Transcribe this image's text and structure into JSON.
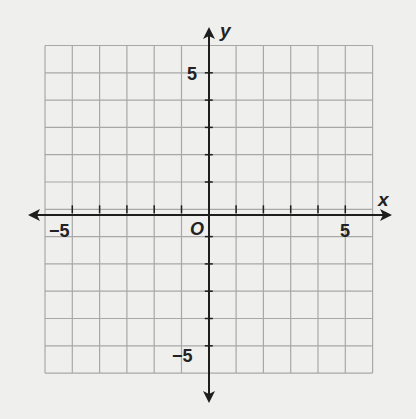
{
  "chart_data": {
    "type": "coordinate-grid",
    "title": "",
    "xlabel": "x",
    "ylabel": "y",
    "xlim": [
      -6,
      6
    ],
    "ylim": [
      -6,
      6
    ],
    "grid": true,
    "grid_step": 1,
    "tick_labels": {
      "x": [
        {
          "value": -5,
          "label": "−5"
        },
        {
          "value": 5,
          "label": "5"
        }
      ],
      "y": [
        {
          "value": 5,
          "label": "5"
        },
        {
          "value": -5,
          "label": "−5"
        }
      ]
    },
    "origin_label": "O",
    "data_points": []
  },
  "labels": {
    "x_axis": "x",
    "y_axis": "y",
    "origin": "O",
    "x_neg5": "−5",
    "x_pos5": "5",
    "y_pos5": "5",
    "y_neg5": "−5"
  },
  "colors": {
    "grid": "#a8a8a8",
    "axis": "#1e1e1e",
    "background": "#efefed"
  }
}
